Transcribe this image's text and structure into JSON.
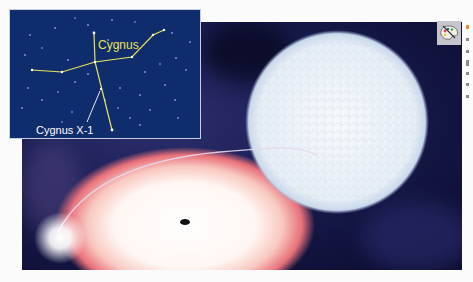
{
  "figure": {
    "inset": {
      "constellation_label": "Cygnus",
      "source_label": "Cygnus X-1",
      "constellation_color": "#e8e35a",
      "pointer_color": "#ffffff",
      "background_color": "#0f2c6c"
    },
    "illustration": {
      "subjects": [
        "blue supergiant star",
        "mass transfer stream",
        "accretion disk",
        "black hole",
        "hot spot glow"
      ],
      "star_color": "#eef3f8",
      "disk_edge_color": "#e8707a",
      "space_color": "#12143f"
    },
    "toolbar": {
      "palette_icon": "palette-icon"
    }
  }
}
